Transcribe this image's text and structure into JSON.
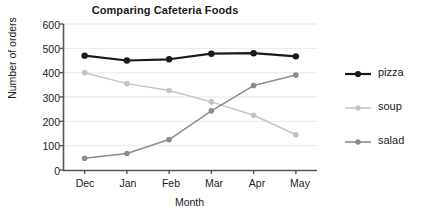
{
  "chart_data": {
    "type": "line",
    "title": "Comparing Cafeteria Foods",
    "xlabel": "Month",
    "ylabel": "Number of orders",
    "categories": [
      "Dec",
      "Jan",
      "Feb",
      "Mar",
      "Apr",
      "May"
    ],
    "yticks": [
      0,
      100,
      200,
      300,
      400,
      500,
      600
    ],
    "ylim": [
      0,
      600
    ],
    "grid": true,
    "legend_position": "right",
    "series": [
      {
        "name": "pizza",
        "color": "#1a1a1a",
        "values": [
          470,
          450,
          455,
          478,
          480,
          467
        ]
      },
      {
        "name": "soup",
        "color": "#c4c4c4",
        "values": [
          400,
          355,
          327,
          280,
          225,
          145
        ]
      },
      {
        "name": "salad",
        "color": "#8c8c8c",
        "values": [
          48,
          68,
          125,
          243,
          347,
          390
        ]
      }
    ]
  },
  "legend": {
    "items": [
      {
        "label": "pizza"
      },
      {
        "label": "soup"
      },
      {
        "label": "salad"
      }
    ]
  },
  "y_tick_labels": [
    "600",
    "500",
    "400",
    "300",
    "200",
    "100",
    "0"
  ],
  "x_tick_labels": [
    "Dec",
    "Jan",
    "Feb",
    "Mar",
    "Apr",
    "May"
  ]
}
